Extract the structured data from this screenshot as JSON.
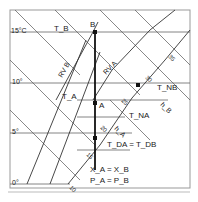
{
  "diagram": {
    "type": "psychrometric (Mollier h-x) chart excerpt",
    "temp_axis": {
      "unit_label": "15°C",
      "ticks": [
        "15°C",
        "10°",
        "5°",
        "0°"
      ]
    },
    "points": {
      "A": "A",
      "B": "B"
    },
    "labels": {
      "TB": "T_B",
      "TA": "T_A",
      "TNA": "T_NA",
      "TNB": "T_NB",
      "hA": "h_A",
      "hB": "h_B",
      "RVB": "RV B",
      "RVA": "RV A",
      "TDA_TDB": "T_DA = T_DB",
      "XA_XB": "X_A = X_B",
      "PA_PB": "P_A = P_B"
    },
    "enthalpy_line_labels": [
      "10",
      "15",
      "20",
      "25",
      "30",
      "35"
    ],
    "colors": {
      "line": "#333333",
      "frame": "#888888",
      "background": "#ffffff"
    }
  }
}
